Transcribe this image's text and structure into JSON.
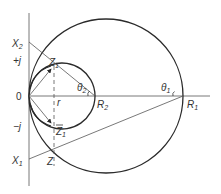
{
  "diagram": {
    "type": "circle-diagram",
    "colors": {
      "stroke": "#2a2a2a",
      "thin": "#555555",
      "text": "#333333",
      "background": "#ffffff"
    },
    "labels": {
      "X2": {
        "main": "X",
        "sub": "2"
      },
      "plus_j": "+j",
      "origin": "0",
      "minus_j": "−j",
      "X1": {
        "main": "X",
        "sub": "1"
      },
      "Z1": {
        "main": "Z",
        "sub": "1"
      },
      "Z1bar": {
        "main": "Z",
        "sub": "1"
      },
      "Z": "Z",
      "r": "r",
      "R2": {
        "main": "R",
        "sub": "2"
      },
      "R1": {
        "main": "R",
        "sub": "1"
      },
      "theta2": {
        "main": "θ",
        "sub": "2"
      },
      "theta1": {
        "main": "θ",
        "sub": "1"
      }
    },
    "elements": {
      "large_circle": {
        "cx": 106,
        "cy": 96,
        "r": 77
      },
      "small_circle": {
        "cx": 62,
        "cy": 96,
        "r": 33,
        "note": "open arc on left side near origin"
      },
      "horizontal_axis": {
        "from": [
          29,
          96
        ],
        "to": [
          210,
          96
        ]
      },
      "vertical_axis": {
        "from": [
          29,
          13
        ],
        "to": [
          29,
          186
        ]
      },
      "dashed_line_r": {
        "x": 54,
        "from_y": 66,
        "to_y": 166
      },
      "line_X2_R2": {
        "from": [
          29,
          42
        ],
        "to": [
          95,
          96
        ]
      },
      "line_X1_R1": {
        "from": [
          29,
          159
        ],
        "to": [
          183,
          96
        ]
      },
      "arrow_to_Z1": {
        "from": [
          29,
          96
        ],
        "to": [
          51,
          68
        ]
      },
      "arrow_to_Z1bar": {
        "from": [
          29,
          96
        ],
        "to": [
          51,
          124
        ]
      }
    }
  }
}
